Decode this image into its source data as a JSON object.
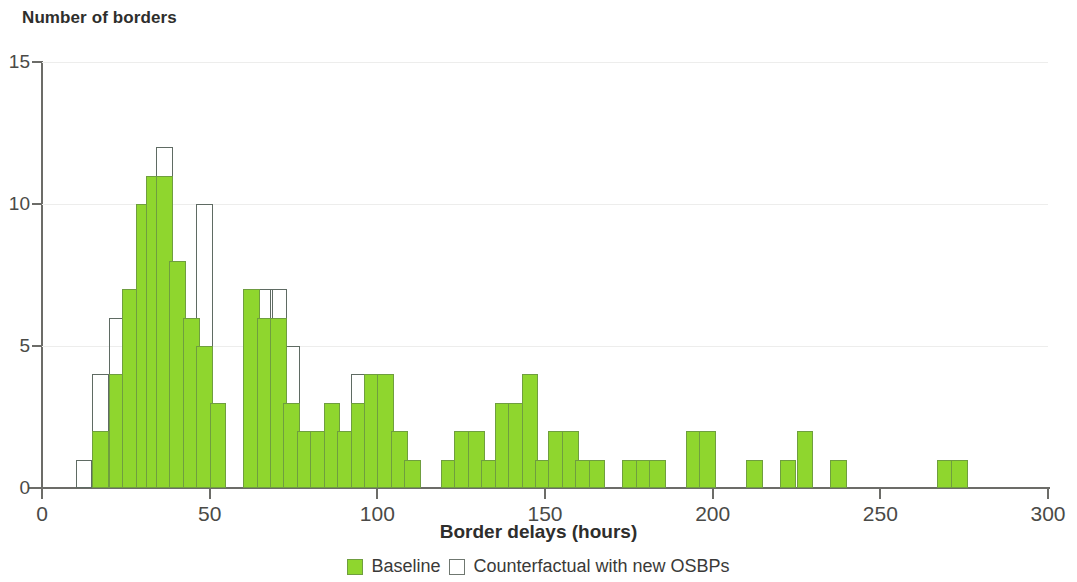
{
  "chart_data": {
    "type": "bar",
    "title": "Number of borders",
    "ylabel": "Number of borders",
    "xlabel": "Border delays (hours)",
    "xlim": [
      0,
      300
    ],
    "ylim": [
      0,
      15
    ],
    "xticks": [
      0,
      50,
      100,
      150,
      200,
      250,
      300
    ],
    "yticks": [
      0,
      5,
      10,
      15
    ],
    "grid": "horizontal",
    "legend_position": "bottom",
    "bin_width": 5,
    "colors": {
      "baseline": "#8fd62e",
      "baseline_edge": "#6f9e3f",
      "counterfactual_edge": "#5f6b63",
      "axis": "#6c6c68",
      "grid": "#ededec",
      "text": "#3a3a38"
    },
    "series": [
      {
        "name": "Baseline",
        "style": "filled",
        "values": [
          0,
          2,
          4,
          7,
          10,
          11,
          8,
          6,
          5,
          3,
          0,
          6,
          6,
          3,
          2,
          2,
          3,
          2,
          4,
          4,
          2,
          1,
          0,
          0,
          1,
          2,
          2,
          1,
          3,
          3,
          4,
          2,
          2,
          2,
          1,
          1,
          0,
          1,
          1,
          1,
          0,
          2,
          2,
          0,
          0,
          1,
          0,
          1,
          2,
          0,
          1,
          0,
          0,
          0,
          1,
          1,
          0,
          0,
          0,
          0
        ]
      },
      {
        "name": "Counterfactual with new OSBPs",
        "style": "outline",
        "values": [
          1,
          4,
          6,
          7,
          10,
          11,
          12,
          7,
          6,
          10,
          3,
          0,
          7,
          7,
          5,
          3,
          2,
          2,
          3,
          2,
          4,
          4,
          2,
          1,
          0,
          0,
          1,
          2,
          2,
          1,
          3,
          3,
          4,
          2,
          2,
          2,
          1,
          1,
          0,
          1,
          1,
          1,
          0,
          2,
          2,
          0,
          0,
          1,
          0,
          1,
          2,
          0,
          1,
          0,
          0,
          0,
          1,
          1,
          0,
          0
        ]
      }
    ],
    "bins": [
      {
        "x0": 10,
        "baseline": 0,
        "counterfactual": 1
      },
      {
        "x0": 15,
        "baseline": 2,
        "counterfactual": 4
      },
      {
        "x0": 20,
        "baseline": 4,
        "counterfactual": 6
      },
      {
        "x0": 24,
        "baseline": 7,
        "counterfactual": 7
      },
      {
        "x0": 28,
        "baseline": 10,
        "counterfactual": 10
      },
      {
        "x0": 31,
        "baseline": 11,
        "counterfactual": 11
      },
      {
        "x0": 34,
        "baseline": 11,
        "counterfactual": 12
      },
      {
        "x0": 38,
        "baseline": 8,
        "counterfactual": 7
      },
      {
        "x0": 42,
        "baseline": 6,
        "counterfactual": 6
      },
      {
        "x0": 46,
        "baseline": 5,
        "counterfactual": 10
      },
      {
        "x0": 50,
        "baseline": 3,
        "counterfactual": 3
      },
      {
        "x0": 60,
        "baseline": 7,
        "counterfactual": 7
      },
      {
        "x0": 64,
        "baseline": 6,
        "counterfactual": 7
      },
      {
        "x0": 68,
        "baseline": 6,
        "counterfactual": 7
      },
      {
        "x0": 72,
        "baseline": 3,
        "counterfactual": 5
      },
      {
        "x0": 76,
        "baseline": 2,
        "counterfactual": 2
      },
      {
        "x0": 80,
        "baseline": 2,
        "counterfactual": 2
      },
      {
        "x0": 84,
        "baseline": 3,
        "counterfactual": 3
      },
      {
        "x0": 88,
        "baseline": 2,
        "counterfactual": 2
      },
      {
        "x0": 92,
        "baseline": 3,
        "counterfactual": 4
      },
      {
        "x0": 96,
        "baseline": 4,
        "counterfactual": 4
      },
      {
        "x0": 100,
        "baseline": 4,
        "counterfactual": 4
      },
      {
        "x0": 104,
        "baseline": 2,
        "counterfactual": 2
      },
      {
        "x0": 108,
        "baseline": 1,
        "counterfactual": 1
      },
      {
        "x0": 119,
        "baseline": 1,
        "counterfactual": 1
      },
      {
        "x0": 123,
        "baseline": 2,
        "counterfactual": 2
      },
      {
        "x0": 127,
        "baseline": 2,
        "counterfactual": 2
      },
      {
        "x0": 131,
        "baseline": 1,
        "counterfactual": 1
      },
      {
        "x0": 135,
        "baseline": 3,
        "counterfactual": 3
      },
      {
        "x0": 139,
        "baseline": 3,
        "counterfactual": 3
      },
      {
        "x0": 143,
        "baseline": 4,
        "counterfactual": 3
      },
      {
        "x0": 147,
        "baseline": 1,
        "counterfactual": 1
      },
      {
        "x0": 151,
        "baseline": 2,
        "counterfactual": 2
      },
      {
        "x0": 155,
        "baseline": 2,
        "counterfactual": 2
      },
      {
        "x0": 159,
        "baseline": 1,
        "counterfactual": 1
      },
      {
        "x0": 163,
        "baseline": 1,
        "counterfactual": 1
      },
      {
        "x0": 173,
        "baseline": 1,
        "counterfactual": 1
      },
      {
        "x0": 177,
        "baseline": 1,
        "counterfactual": 1
      },
      {
        "x0": 181,
        "baseline": 1,
        "counterfactual": 1
      },
      {
        "x0": 192,
        "baseline": 2,
        "counterfactual": 2
      },
      {
        "x0": 196,
        "baseline": 2,
        "counterfactual": 2
      },
      {
        "x0": 210,
        "baseline": 1,
        "counterfactual": 1
      },
      {
        "x0": 220,
        "baseline": 1,
        "counterfactual": 1
      },
      {
        "x0": 225,
        "baseline": 2,
        "counterfactual": 2
      },
      {
        "x0": 235,
        "baseline": 1,
        "counterfactual": 1
      },
      {
        "x0": 267,
        "baseline": 1,
        "counterfactual": 1
      },
      {
        "x0": 271,
        "baseline": 1,
        "counterfactual": 1
      }
    ]
  },
  "legend": {
    "items": [
      {
        "label": "Baseline",
        "style": "fill"
      },
      {
        "label": "Counterfactual with new OSBPs",
        "style": "hollow"
      }
    ]
  }
}
